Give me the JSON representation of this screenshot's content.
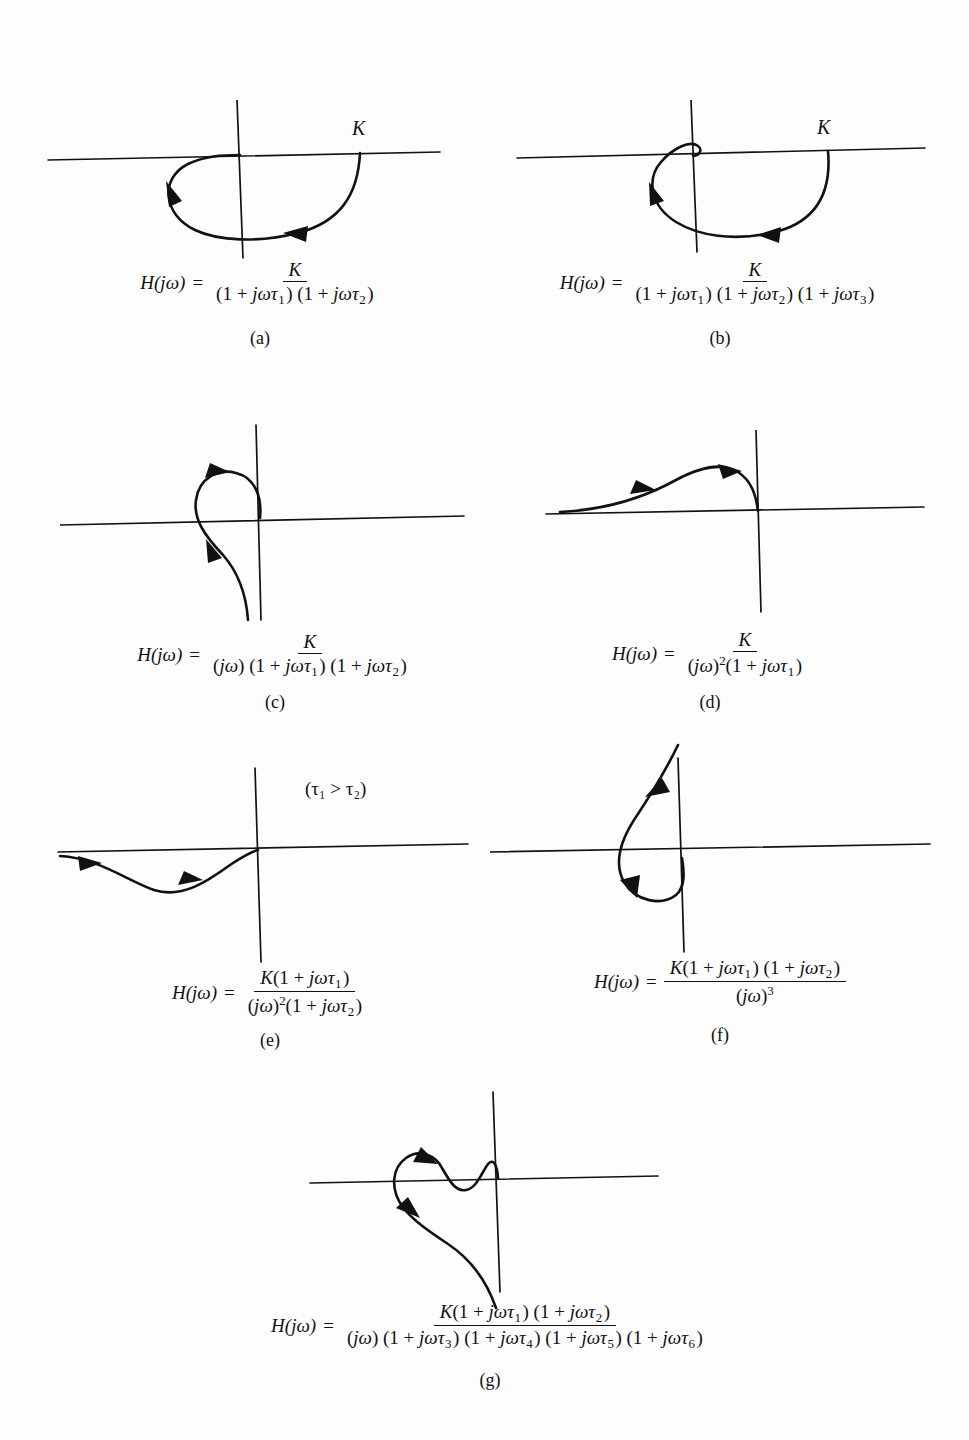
{
  "figure": {
    "type": "diagram",
    "background": "#fdfdfd",
    "ink_color": "#111111"
  },
  "panels": [
    {
      "id": "a",
      "caption": "(a)",
      "k_label": "K",
      "formula": {
        "lhs": "H(jω)",
        "equals": "=",
        "numerator": "K",
        "denominator": "(1 + jωτ₁) (1 + jωτ₂)"
      },
      "curve_description": "Semicircular arc from K on positive real axis sweeping clockwise through the fourth and third quadrants back to the origin",
      "arrow_count": 2
    },
    {
      "id": "b",
      "caption": "(b)",
      "k_label": "K",
      "formula": {
        "lhs": "H(jω)",
        "equals": "=",
        "numerator": "K",
        "denominator": "(1 + jωτ₁) (1 + jωτ₂) (1 + jωτ₃)"
      },
      "curve_description": "Large arc from K sweeping below the real axis into the third quadrant then spiralling up across the negative real axis into a small loop ending at the origin",
      "arrow_count": 2
    },
    {
      "id": "c",
      "caption": "(c)",
      "k_label": "",
      "formula": {
        "lhs": "H(jω)",
        "equals": "=",
        "numerator": "K",
        "denominator": "(jω) (1 + jωτ₁) (1 + jωτ₂)"
      },
      "curve_description": "Tail coming up from negative imaginary infinity, curving left across the negative real axis into a teardrop loop that ends at the origin",
      "arrow_count": 2
    },
    {
      "id": "d",
      "caption": "(d)",
      "k_label": "",
      "formula": {
        "lhs": "H(jω)",
        "equals": "=",
        "numerator": "K",
        "denominator": "(jω)²(1 + jωτ₁)"
      },
      "curve_description": "Curve tangent to the negative real axis at infinity, rising into the second quadrant hump and descending steeply to the origin",
      "arrow_count": 2
    },
    {
      "id": "e",
      "caption": "(e)",
      "k_label": "",
      "note": "(τ₁ > τ₂)",
      "formula": {
        "lhs": "H(jω)",
        "equals": "=",
        "numerator": "K(1 + jωτ₁)",
        "denominator": "(jω)²(1 + jωτ₂)"
      },
      "curve_description": "Curve tangent to the negative real axis at infinity dipping into the third quadrant and rising back to the origin",
      "arrow_count": 2
    },
    {
      "id": "f",
      "caption": "(f)",
      "k_label": "",
      "formula": {
        "lhs": "H(jω)",
        "equals": "=",
        "numerator": "K(1 + jωτ₁) (1 + jωτ₂)",
        "denominator": "(jω)³"
      },
      "curve_description": "Tail descending from upper right, looping counterclockwise down through the third quadrant and back up to the imaginary axis below the origin",
      "arrow_count": 2
    },
    {
      "id": "g",
      "caption": "(g)",
      "k_label": "",
      "formula": {
        "lhs": "H(jω)",
        "equals": "=",
        "numerator": "K(1 + jωτ₁) (1 + jωτ₂)",
        "denominator": "(jω) (1 + jωτ₃) (1 + jωτ₄) (1 + jωτ₅) (1 + jωτ₆)"
      },
      "curve_description": "Tail rising from lower right, hooking left past the negative real axis, then oscillating in an S-wave across the real axis and ending at the origin",
      "arrow_count": 2
    }
  ]
}
